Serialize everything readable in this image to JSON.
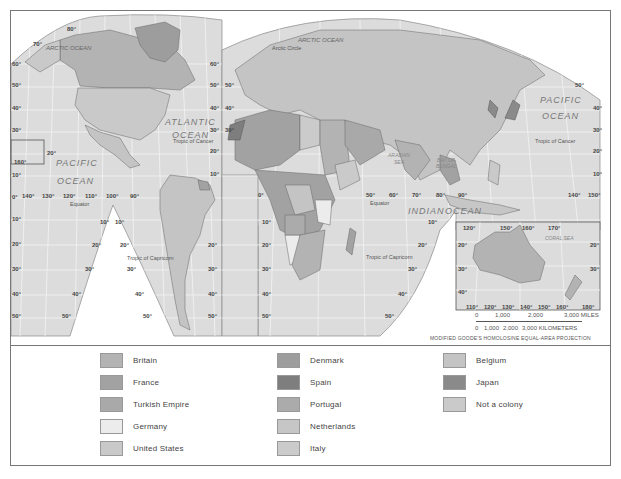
{
  "map": {
    "projection_note": "MODIFIED GOODE'S HOMOLOSINE EQUAL-AREA PROJECTION",
    "ocean_labels": {
      "arctic_west": "ARCTIC OCEAN",
      "arctic_east": "ARCTIC OCEAN",
      "atlantic_1": "ATLANTIC",
      "atlantic_2": "OCEAN",
      "pacific_west_1": "PACIFIC",
      "pacific_west_2": "OCEAN",
      "pacific_east_1": "PACIFIC",
      "pacific_east_2": "OCEAN",
      "indian_1": "INDIAN",
      "indian_2": "OCEAN",
      "arabian_1": "ARABIAN",
      "arabian_2": "SEA",
      "bengal_1": "BAY OF",
      "bengal_2": "BENGAL",
      "coral": "CORAL SEA"
    },
    "line_labels": {
      "tropic_cancer": "Tropic of Cancer",
      "tropic_capricorn": "Tropic of Capricorn",
      "equator": "Equator",
      "arctic_circle": "Arctic Circle"
    },
    "lat_ticks": [
      "80°",
      "70°",
      "60°",
      "50°",
      "40°",
      "30°",
      "20°",
      "10°",
      "0°",
      "10°",
      "20°",
      "30°",
      "40°",
      "50°"
    ],
    "lon_ticks_west": [
      "160°",
      "140°",
      "130°",
      "120°",
      "110°",
      "100°",
      "90°"
    ],
    "lon_ticks_east": [
      "0°",
      "50°",
      "60°",
      "70°",
      "80°",
      "90°",
      "140°",
      "150°"
    ],
    "australia_inset_lon_top": [
      "120°",
      "150°",
      "160°",
      "170°"
    ],
    "australia_inset_lon_bottom": [
      "110°",
      "120°",
      "130°",
      "140°",
      "150°",
      "160°",
      "180°"
    ],
    "australia_inset_lat": [
      "20°",
      "30°",
      "40°"
    ]
  },
  "scale": {
    "miles_ticks": [
      "0",
      "1,000",
      "2,000",
      "3,000 MILES"
    ],
    "km_ticks": [
      "0",
      "1,000",
      "2,000",
      "3,000 KILOMETERS"
    ]
  },
  "legend": {
    "items": [
      {
        "label": "Britain",
        "color": "#b3b3b3"
      },
      {
        "label": "France",
        "color": "#a2a2a2"
      },
      {
        "label": "Turkish Empire",
        "color": "#a9a9a9"
      },
      {
        "label": "Germany",
        "color": "#ececec"
      },
      {
        "label": "United States",
        "color": "#c9c9c9"
      },
      {
        "label": "Denmark",
        "color": "#9d9d9d"
      },
      {
        "label": "Spain",
        "color": "#7e7e7e"
      },
      {
        "label": "Portugal",
        "color": "#ababab"
      },
      {
        "label": "Netherlands",
        "color": "#c6c6c6"
      },
      {
        "label": "Italy",
        "color": "#cbcbcb"
      },
      {
        "label": "Belgium",
        "color": "#c4c4c4"
      },
      {
        "label": "Japan",
        "color": "#8a8a8a"
      },
      {
        "label": "Not a colony",
        "color": "#cacaca"
      }
    ]
  },
  "colors": {
    "ocean": "#dcdcdc",
    "graticule": "#f4f4f4",
    "land_default": "#c4c4c4",
    "border": "#666666"
  }
}
